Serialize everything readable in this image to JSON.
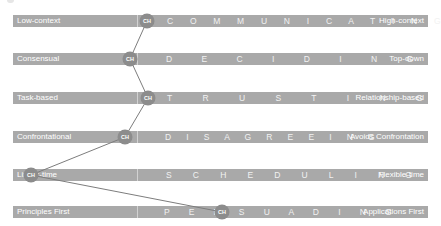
{
  "diagram": {
    "bar_color": "#a9a9a9",
    "marker_color": "#8c8c8c",
    "line_color": "#7d7d7d",
    "marker_label": "CH",
    "scales": [
      {
        "name": "C O M M U N I C A T I N G",
        "left": "Low-context",
        "right": "High-context",
        "marker_x": 147
      },
      {
        "name": "D E C I D I N G",
        "left": "Consensual",
        "right": "Top-down",
        "marker_x": 130
      },
      {
        "name": "T R U S T I N G",
        "left": "Task-based",
        "right": "Relationship-based",
        "marker_x": 148
      },
      {
        "name": "D I S A G R E E I N G",
        "left": "Confrontational",
        "right": "Avoids Confrontation",
        "marker_x": 125
      },
      {
        "name": "S C H E D U L I N G",
        "left": "Linear-time",
        "right": "Flexible-time",
        "marker_x": 31
      },
      {
        "name": "P E R S U A D I N G",
        "left": "Principles First",
        "right": "Applications First",
        "marker_x": 222
      }
    ]
  }
}
